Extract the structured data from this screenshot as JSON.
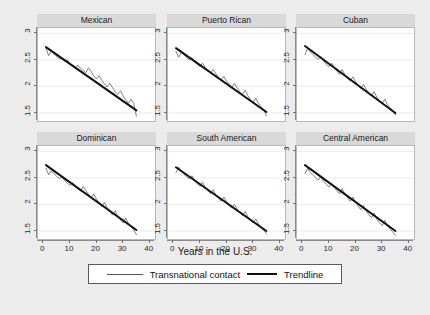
{
  "figure": {
    "background_color": "#ececec",
    "panel_header_color": "#d9d9d9",
    "xlabel": "Years in the U.S.",
    "legend": {
      "series_label": "Transnational contact",
      "trend_label": "Trendline"
    }
  },
  "chart_data": {
    "type": "line",
    "title": "",
    "xlabel": "Years in the U.S.",
    "ylabel": "",
    "xlim": [
      -2,
      42
    ],
    "ylim": [
      1.35,
      3.1
    ],
    "xticks": [
      0,
      10,
      20,
      30,
      40
    ],
    "yticks": [
      1.5,
      2,
      2.5,
      3
    ],
    "grid": true,
    "legend_position": "bottom",
    "panels": [
      {
        "title": "Mexican",
        "row": 0,
        "col": 0,
        "series": [
          {
            "name": "Transnational contact",
            "x": [
              1,
              2,
              3,
              4,
              5,
              6,
              7,
              8,
              9,
              10,
              11,
              12,
              13,
              14,
              15,
              16,
              17,
              18,
              19,
              20,
              21,
              22,
              23,
              24,
              25,
              26,
              27,
              28,
              29,
              30,
              31,
              32,
              33,
              34,
              35
            ],
            "y": [
              2.72,
              2.58,
              2.66,
              2.62,
              2.57,
              2.52,
              2.52,
              2.47,
              2.5,
              2.43,
              2.39,
              2.36,
              2.4,
              2.34,
              2.3,
              2.26,
              2.35,
              2.28,
              2.2,
              2.14,
              2.2,
              2.12,
              2.05,
              1.99,
              2.06,
              1.98,
              1.9,
              1.85,
              1.92,
              1.82,
              1.75,
              1.68,
              1.76,
              1.68,
              1.44
            ]
          },
          {
            "name": "Trendline",
            "x": [
              1,
              35
            ],
            "y": [
              2.74,
              1.55
            ]
          }
        ]
      },
      {
        "title": "Puerto Rican",
        "row": 0,
        "col": 1,
        "series": [
          {
            "name": "Transnational contact",
            "x": [
              1,
              2,
              3,
              4,
              5,
              6,
              7,
              8,
              9,
              10,
              11,
              12,
              13,
              14,
              15,
              16,
              17,
              18,
              19,
              20,
              21,
              22,
              23,
              24,
              25,
              26,
              27,
              28,
              29,
              30,
              31,
              32,
              33,
              34,
              35
            ],
            "y": [
              2.66,
              2.55,
              2.64,
              2.6,
              2.54,
              2.5,
              2.54,
              2.46,
              2.42,
              2.37,
              2.44,
              2.36,
              2.3,
              2.25,
              2.32,
              2.24,
              2.17,
              2.12,
              2.19,
              2.1,
              2.04,
              1.98,
              2.06,
              1.97,
              1.9,
              1.85,
              1.93,
              1.83,
              1.76,
              1.7,
              1.78,
              1.68,
              1.62,
              1.56,
              1.45
            ]
          },
          {
            "name": "Trendline",
            "x": [
              1,
              35
            ],
            "y": [
              2.72,
              1.52
            ]
          }
        ]
      },
      {
        "title": "Cuban",
        "row": 0,
        "col": 2,
        "series": [
          {
            "name": "Transnational contact",
            "x": [
              1,
              2,
              3,
              4,
              5,
              6,
              7,
              8,
              9,
              10,
              11,
              12,
              13,
              14,
              15,
              16,
              17,
              18,
              19,
              20,
              21,
              22,
              23,
              24,
              25,
              26,
              27,
              28,
              29,
              30,
              31,
              32,
              33,
              34,
              35
            ],
            "y": [
              2.6,
              2.72,
              2.65,
              2.6,
              2.55,
              2.51,
              2.56,
              2.48,
              2.42,
              2.37,
              2.44,
              2.35,
              2.29,
              2.23,
              2.32,
              2.22,
              2.16,
              2.1,
              2.18,
              2.09,
              2.02,
              1.96,
              2.04,
              1.95,
              1.88,
              1.82,
              1.9,
              1.8,
              1.73,
              1.67,
              1.76,
              1.66,
              1.6,
              1.54,
              1.47
            ]
          },
          {
            "name": "Trendline",
            "x": [
              1,
              35
            ],
            "y": [
              2.76,
              1.5
            ]
          }
        ]
      },
      {
        "title": "Dominican",
        "row": 1,
        "col": 0,
        "series": [
          {
            "name": "Transnational contact",
            "x": [
              1,
              2,
              3,
              4,
              5,
              6,
              7,
              8,
              9,
              10,
              11,
              12,
              13,
              14,
              15,
              16,
              17,
              18,
              19,
              20,
              21,
              22,
              23,
              24,
              25,
              26,
              27,
              28,
              29,
              30,
              31,
              32,
              33,
              34,
              35
            ],
            "y": [
              2.68,
              2.56,
              2.63,
              2.58,
              2.53,
              2.49,
              2.52,
              2.45,
              2.4,
              2.36,
              2.41,
              2.34,
              2.29,
              2.25,
              2.34,
              2.26,
              2.19,
              2.12,
              2.2,
              2.1,
              2.03,
              1.96,
              2.04,
              1.94,
              1.87,
              1.8,
              1.88,
              1.78,
              1.71,
              1.65,
              1.74,
              1.64,
              1.58,
              1.52,
              1.43
            ]
          },
          {
            "name": "Trendline",
            "x": [
              1,
              35
            ],
            "y": [
              2.74,
              1.52
            ]
          }
        ]
      },
      {
        "title": "South American",
        "row": 1,
        "col": 1,
        "series": [
          {
            "name": "Transnational contact",
            "x": [
              1,
              2,
              3,
              4,
              5,
              6,
              7,
              8,
              9,
              10,
              11,
              12,
              13,
              14,
              15,
              16,
              17,
              18,
              19,
              20,
              21,
              22,
              23,
              24,
              25,
              26,
              27,
              28,
              29,
              30,
              31,
              32,
              33,
              34,
              35
            ],
            "y": [
              2.6,
              2.7,
              2.62,
              2.57,
              2.52,
              2.48,
              2.54,
              2.45,
              2.39,
              2.34,
              2.42,
              2.32,
              2.26,
              2.2,
              2.28,
              2.18,
              2.12,
              2.06,
              2.14,
              2.05,
              1.99,
              1.93,
              2.0,
              1.91,
              1.85,
              1.79,
              1.87,
              1.77,
              1.71,
              1.65,
              1.73,
              1.63,
              1.57,
              1.51,
              1.45
            ]
          },
          {
            "name": "Trendline",
            "x": [
              1,
              35
            ],
            "y": [
              2.7,
              1.5
            ]
          }
        ]
      },
      {
        "title": "Central American",
        "row": 1,
        "col": 2,
        "series": [
          {
            "name": "Transnational contact",
            "x": [
              1,
              2,
              3,
              4,
              5,
              6,
              7,
              8,
              9,
              10,
              11,
              12,
              13,
              14,
              15,
              16,
              17,
              18,
              19,
              20,
              21,
              22,
              23,
              24,
              25,
              26,
              27,
              28,
              29,
              30,
              31,
              32,
              33,
              34,
              35
            ],
            "y": [
              2.58,
              2.68,
              2.6,
              2.56,
              2.5,
              2.46,
              2.52,
              2.44,
              2.38,
              2.33,
              2.4,
              2.32,
              2.26,
              2.2,
              2.3,
              2.2,
              2.13,
              2.06,
              2.14,
              2.04,
              1.97,
              1.9,
              1.98,
              1.88,
              1.81,
              1.75,
              1.84,
              1.73,
              1.66,
              1.6,
              1.7,
              1.6,
              1.54,
              1.48,
              1.42
            ]
          },
          {
            "name": "Trendline",
            "x": [
              1,
              35
            ],
            "y": [
              2.74,
              1.5
            ]
          }
        ]
      }
    ]
  }
}
